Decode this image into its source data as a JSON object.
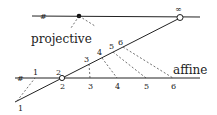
{
  "labels": {
    "projective": "projective",
    "affine": "affine",
    "infinity": "∞",
    "parallel_mark": "#"
  },
  "affine_points": [
    "1",
    "2",
    "3",
    "4",
    "5",
    "6"
  ],
  "slanted_points": [
    "1",
    "2",
    "3",
    "4",
    "5",
    "6"
  ],
  "colors": {
    "line": "#222222",
    "background": "#ffffff"
  }
}
